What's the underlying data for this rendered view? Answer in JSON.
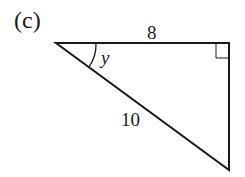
{
  "figure": {
    "part_label": "(c)",
    "shape": "right-triangle",
    "sides": {
      "top": "8",
      "hypotenuse": "10"
    },
    "angle_label": "y",
    "right_angle_marker": true,
    "stroke_color": "#1a1a1a"
  }
}
